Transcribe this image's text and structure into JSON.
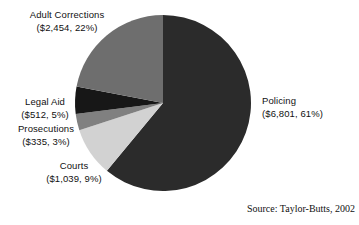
{
  "chart_data": {
    "type": "pie",
    "title": "",
    "source": "Source: Taylor-Butts, 2002",
    "center": {
      "cx": 163,
      "cy": 103,
      "r": 88
    },
    "start_angle_deg": -90,
    "direction": "clockwise",
    "units": "millions of dollars",
    "categories": [
      "Policing",
      "Courts",
      "Prosecutions",
      "Legal Aid",
      "Adult Corrections"
    ],
    "values": [
      6801,
      1039,
      335,
      512,
      2454
    ],
    "percentages": [
      61,
      9,
      3,
      5,
      22
    ],
    "colors": [
      "#2b2b2b",
      "#d2d2d2",
      "#808080",
      "#171717",
      "#6e6e6e"
    ],
    "slices": [
      {
        "name": "Policing",
        "amount": "$6,801",
        "percent": "61%",
        "value": 6801,
        "pct": 61,
        "color": "#2b2b2b",
        "label_line1": "Policing",
        "label_line2": "($6,801, 61%)"
      },
      {
        "name": "Courts",
        "amount": "$1,039",
        "percent": "9%",
        "value": 1039,
        "pct": 9,
        "color": "#d2d2d2",
        "label_line1": "Courts",
        "label_line2": "($1,039, 9%)"
      },
      {
        "name": "Prosecutions",
        "amount": "$335",
        "percent": "3%",
        "value": 335,
        "pct": 3,
        "color": "#808080",
        "label_line1": "Prosecutions",
        "label_line2": "($335, 3%)"
      },
      {
        "name": "Legal Aid",
        "amount": "$512",
        "percent": "5%",
        "value": 512,
        "pct": 5,
        "color": "#171717",
        "label_line1": "Legal Aid",
        "label_line2": "($512, 5%)"
      },
      {
        "name": "Adult Corrections",
        "amount": "$2,454",
        "percent": "22%",
        "value": 2454,
        "pct": 22,
        "color": "#6e6e6e",
        "label_line1": "Adult Corrections",
        "label_line2": "($2,454, 22%)"
      }
    ],
    "legend_position": "callout-labels",
    "grid": false,
    "background": "#ffffff"
  }
}
